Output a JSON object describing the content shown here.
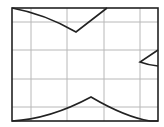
{
  "diagram": {
    "type": "grid-with-curves",
    "frame": {
      "x": 12,
      "y": 8,
      "width": 146,
      "height": 113,
      "stroke": "#222222"
    },
    "grid": {
      "color": "#b8b8b8",
      "vertical_x": [
        31,
        67,
        104,
        140
      ],
      "horizontal_y": [
        22,
        50,
        79,
        107
      ]
    },
    "curves": [
      {
        "name": "top-v-curve",
        "path": "M12,8 Q45,14 76,32 L107,8",
        "stroke": "#222222"
      },
      {
        "name": "bottom-peak-curve",
        "path": "M12,121 Q50,119 91,97 Q125,117 150,121 L158,121",
        "stroke": "#222222"
      },
      {
        "name": "right-chevron",
        "path": "M158,50 L140,62 Q148,65 158,66",
        "stroke": "#222222"
      }
    ]
  }
}
